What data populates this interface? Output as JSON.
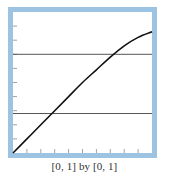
{
  "chart_data": {
    "type": "line",
    "title": "",
    "caption": "[0, 1] by [0, 1]",
    "xlabel": "",
    "ylabel": "",
    "xlim": [
      0,
      1
    ],
    "ylim": [
      0,
      1
    ],
    "x_tick_step": 0.1,
    "y_tick_step": 0.1,
    "grid": false,
    "legend": null,
    "frame_color": "#9cc3e2",
    "series": [
      {
        "name": "curve",
        "color": "#111111",
        "x": [
          0.0,
          0.1,
          0.2,
          0.3,
          0.4,
          0.5,
          0.6,
          0.7,
          0.8,
          0.9,
          1.0
        ],
        "y": [
          0.0,
          0.1,
          0.2,
          0.3,
          0.4,
          0.5,
          0.59,
          0.68,
          0.76,
          0.82,
          0.86
        ]
      },
      {
        "name": "horizontal-line-upper",
        "color": "#555555",
        "x": [
          0,
          1
        ],
        "y": [
          0.7,
          0.7
        ]
      },
      {
        "name": "horizontal-line-lower",
        "color": "#555555",
        "x": [
          0,
          1
        ],
        "y": [
          0.28,
          0.28
        ]
      }
    ],
    "intersections": [
      {
        "x": 0.29,
        "y": 0.28
      },
      {
        "x": 0.73,
        "y": 0.7
      }
    ]
  }
}
